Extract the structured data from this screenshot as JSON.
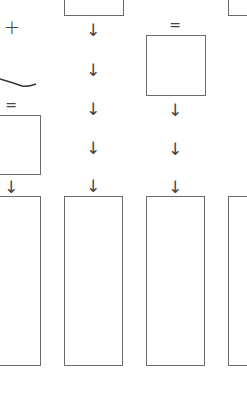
{
  "diagram": {
    "symbols": {
      "plus": "+",
      "equals": "=",
      "arrow_down": "↓"
    },
    "stroke_color": "#6b6b6b",
    "glyph_color": "#444444",
    "boxes": [
      {
        "id": "top-box-col2",
        "x": 64,
        "y": -2,
        "w": 60,
        "h": 18
      },
      {
        "id": "top-box-col4",
        "x": 228,
        "y": -2,
        "w": 22,
        "h": 18
      },
      {
        "id": "square-box-col3",
        "x": 146,
        "y": 35,
        "w": 60,
        "h": 61
      },
      {
        "id": "square-box-col1",
        "x": -2,
        "y": 115,
        "w": 43,
        "h": 60
      },
      {
        "id": "tall-box-col1",
        "x": -2,
        "y": 196,
        "w": 43,
        "h": 170
      },
      {
        "id": "tall-box-col2",
        "x": 64,
        "y": 196,
        "w": 59,
        "h": 170
      },
      {
        "id": "tall-box-col3",
        "x": 146,
        "y": 196,
        "w": 59,
        "h": 170
      },
      {
        "id": "tall-box-col4",
        "x": 228,
        "y": 196,
        "w": 22,
        "h": 170
      }
    ],
    "arrows": [
      {
        "x": 93,
        "y": 30
      },
      {
        "x": 93,
        "y": 70
      },
      {
        "x": 93,
        "y": 109
      },
      {
        "x": 93,
        "y": 148
      },
      {
        "x": 93,
        "y": 186
      },
      {
        "x": 175,
        "y": 110
      },
      {
        "x": 175,
        "y": 149
      },
      {
        "x": 175,
        "y": 187
      },
      {
        "x": 11,
        "y": 187
      }
    ],
    "equals_signs": [
      {
        "x": 175,
        "y": 25
      },
      {
        "x": 11,
        "y": 105
      }
    ],
    "plus_signs": [
      {
        "x": 12,
        "y": 27
      }
    ]
  }
}
